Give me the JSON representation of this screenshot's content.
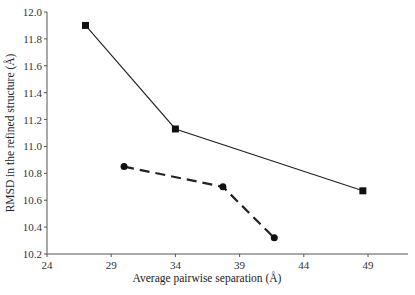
{
  "chart_data": {
    "type": "line",
    "title": "",
    "xlabel": "Average pairwise separation (Å)",
    "ylabel": "RMSD in the refined structure (Å)",
    "xlim": [
      24,
      52
    ],
    "ylim": [
      10.2,
      12.0
    ],
    "x_ticks": [
      "24",
      "29",
      "34",
      "39",
      "44",
      "49"
    ],
    "y_ticks": [
      "10.2",
      "10.4",
      "10.6",
      "10.8",
      "11.0",
      "11.2",
      "11.4",
      "11.6",
      "11.8",
      "12.0"
    ],
    "grid": false,
    "legend": null,
    "series": [
      {
        "name": "squares (solid line)",
        "marker": "square",
        "line_style": "solid",
        "x": [
          27,
          34,
          48.6
        ],
        "y": [
          11.9,
          11.13,
          10.67
        ]
      },
      {
        "name": "circles (dashed line)",
        "marker": "circle",
        "line_style": "dashed",
        "x": [
          30,
          37.7,
          41.7
        ],
        "y": [
          10.85,
          10.7,
          10.32
        ]
      }
    ]
  }
}
